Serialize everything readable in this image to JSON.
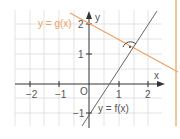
{
  "diagram": {
    "type": "coordinate-plot",
    "axes": {
      "x_label": "x",
      "y_label": "y",
      "origin_label": "O",
      "x_ticks": [
        "−2",
        "−1",
        "1",
        "2"
      ],
      "y_ticks": [
        "2",
        "1",
        "−1"
      ]
    },
    "lines": [
      {
        "name": "g",
        "label": "y = g(x)",
        "color": "#f0a060",
        "slope": -0.72,
        "intercept": 2
      },
      {
        "name": "f",
        "label": "y = f(x)",
        "color": "#555555",
        "slope": 1.39,
        "intercept": -1
      }
    ],
    "annotation": {
      "type": "right-angle-marker",
      "at": "intersection of f and g"
    },
    "colors": {
      "accent": "#f0a060",
      "grid": "#d8d8d8",
      "axis": "#333333",
      "border": "#f0b070"
    }
  }
}
